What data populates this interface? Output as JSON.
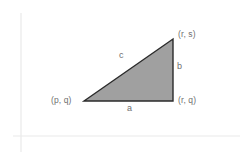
{
  "diagram": {
    "kind": "right-triangle-geometry-diagram",
    "background_color": "#ffffff",
    "axes": {
      "color": "#e9e9e9",
      "vertical": {
        "x": 21,
        "y_top": 13,
        "y_bottom": 152
      },
      "horizontal": {
        "y": 136,
        "x_left": 13,
        "x_right": 240
      }
    },
    "triangle": {
      "fill_color": "#a0a0a0",
      "stroke_color": "#2b2b2b",
      "stroke_width": 1.4,
      "vertices": [
        {
          "name": "bottom-left",
          "x": 84,
          "y": 101
        },
        {
          "name": "top-right",
          "x": 173,
          "y": 39
        },
        {
          "name": "bottom-right",
          "x": 173,
          "y": 101
        }
      ]
    },
    "text_color": "#6f6f6f",
    "vertex_labels": {
      "top_right": "(r, s)",
      "bottom_right": "(r, q)",
      "bottom_left": "(p, q)"
    },
    "side_labels": {
      "bottom": "a",
      "right": "b",
      "hypotenuse": "c"
    }
  }
}
